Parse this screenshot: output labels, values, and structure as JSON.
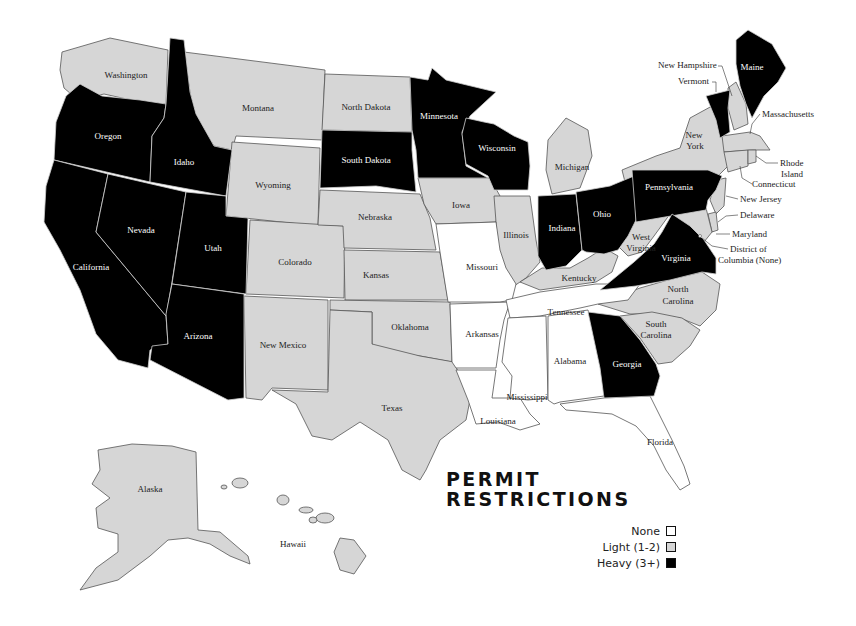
{
  "title": [
    "PERMIT",
    "RESTRICTIONS"
  ],
  "legend": {
    "items": [
      {
        "label": "None",
        "level": "none",
        "color": "#ffffff"
      },
      {
        "label": "Light (1-2)",
        "level": "light",
        "color": "#d6d6d6"
      },
      {
        "label": "Heavy (3+)",
        "level": "heavy",
        "color": "#000000"
      }
    ]
  },
  "colors": {
    "none": "#ffffff",
    "light": "#d6d6d6",
    "heavy": "#000000",
    "border_light": "#555555",
    "border_heavy": "#cccccc"
  },
  "states": [
    {
      "name": "Washington",
      "level": "light"
    },
    {
      "name": "Oregon",
      "level": "heavy"
    },
    {
      "name": "California",
      "level": "heavy"
    },
    {
      "name": "Idaho",
      "level": "heavy"
    },
    {
      "name": "Nevada",
      "level": "heavy"
    },
    {
      "name": "Utah",
      "level": "heavy"
    },
    {
      "name": "Arizona",
      "level": "heavy"
    },
    {
      "name": "Montana",
      "level": "light"
    },
    {
      "name": "Wyoming",
      "level": "light"
    },
    {
      "name": "Colorado",
      "level": "light"
    },
    {
      "name": "New Mexico",
      "level": "light"
    },
    {
      "name": "North Dakota",
      "level": "light"
    },
    {
      "name": "South Dakota",
      "level": "heavy"
    },
    {
      "name": "Nebraska",
      "level": "light"
    },
    {
      "name": "Kansas",
      "level": "light"
    },
    {
      "name": "Oklahoma",
      "level": "light"
    },
    {
      "name": "Texas",
      "level": "light"
    },
    {
      "name": "Minnesota",
      "level": "heavy"
    },
    {
      "name": "Iowa",
      "level": "light"
    },
    {
      "name": "Missouri",
      "level": "none"
    },
    {
      "name": "Arkansas",
      "level": "none"
    },
    {
      "name": "Louisiana",
      "level": "none"
    },
    {
      "name": "Wisconsin",
      "level": "heavy"
    },
    {
      "name": "Illinois",
      "level": "light"
    },
    {
      "name": "Michigan",
      "level": "light"
    },
    {
      "name": "Indiana",
      "level": "heavy"
    },
    {
      "name": "Ohio",
      "level": "heavy"
    },
    {
      "name": "Kentucky",
      "level": "light"
    },
    {
      "name": "Tennessee",
      "level": "none"
    },
    {
      "name": "Mississippi",
      "level": "none"
    },
    {
      "name": "Alabama",
      "level": "none"
    },
    {
      "name": "Georgia",
      "level": "heavy"
    },
    {
      "name": "Florida",
      "level": "none"
    },
    {
      "name": "South Carolina",
      "level": "light"
    },
    {
      "name": "North Carolina",
      "level": "light"
    },
    {
      "name": "Virginia",
      "level": "heavy"
    },
    {
      "name": "West Virginia",
      "level": "light"
    },
    {
      "name": "Pennsylvania",
      "level": "heavy"
    },
    {
      "name": "New York",
      "level": "light"
    },
    {
      "name": "Vermont",
      "level": "heavy"
    },
    {
      "name": "New Hampshire",
      "level": "light"
    },
    {
      "name": "Maine",
      "level": "heavy"
    },
    {
      "name": "Massachusetts",
      "level": "light"
    },
    {
      "name": "Rhode Island",
      "level": "light"
    },
    {
      "name": "Connecticut",
      "level": "light"
    },
    {
      "name": "New Jersey",
      "level": "light"
    },
    {
      "name": "Delaware",
      "level": "light"
    },
    {
      "name": "Maryland",
      "level": "light"
    },
    {
      "name": "District of Columbia (None)",
      "level": "none"
    },
    {
      "name": "Alaska",
      "level": "light"
    },
    {
      "name": "Hawaii",
      "level": "light"
    }
  ],
  "labels": {
    "washington": "Washington",
    "oregon": "Oregon",
    "california": "California",
    "idaho": "Idaho",
    "nevada": "Nevada",
    "utah": "Utah",
    "arizona": "Arizona",
    "montana": "Montana",
    "wyoming": "Wyoming",
    "colorado": "Colorado",
    "new_mexico": "New Mexico",
    "north_dakota": "North Dakota",
    "south_dakota": "South Dakota",
    "nebraska": "Nebraska",
    "kansas": "Kansas",
    "oklahoma": "Oklahoma",
    "texas": "Texas",
    "minnesota": "Minnesota",
    "iowa": "Iowa",
    "missouri": "Missouri",
    "arkansas": "Arkansas",
    "louisiana": "Louisiana",
    "wisconsin": "Wisconsin",
    "illinois": "Illinois",
    "michigan": "Michigan",
    "indiana": "Indiana",
    "ohio": "Ohio",
    "kentucky": "Kentucky",
    "tennessee": "Tennessee",
    "mississippi": "Mississippi",
    "alabama": "Alabama",
    "georgia": "Georgia",
    "florida": "Florida",
    "south_carolina_1": "South",
    "south_carolina_2": "Carolina",
    "north_carolina_1": "North",
    "north_carolina_2": "Carolina",
    "virginia": "Virginia",
    "west_virginia_1": "West",
    "west_virginia_2": "Virginia",
    "pennsylvania": "Pennsylvania",
    "new_york_1": "New",
    "new_york_2": "York",
    "maine": "Maine",
    "alaska": "Alaska",
    "hawaii": "Hawaii"
  },
  "callouts": {
    "new_hampshire": "New Hampshire",
    "vermont": "Vermont",
    "massachusetts": "Massachusetts",
    "rhode_island_1": "Rhode",
    "rhode_island_2": "Island",
    "connecticut": "Connecticut",
    "new_jersey": "New Jersey",
    "delaware": "Delaware",
    "maryland": "Maryland",
    "dc_1": "District of",
    "dc_2": "Columbia (None)"
  }
}
